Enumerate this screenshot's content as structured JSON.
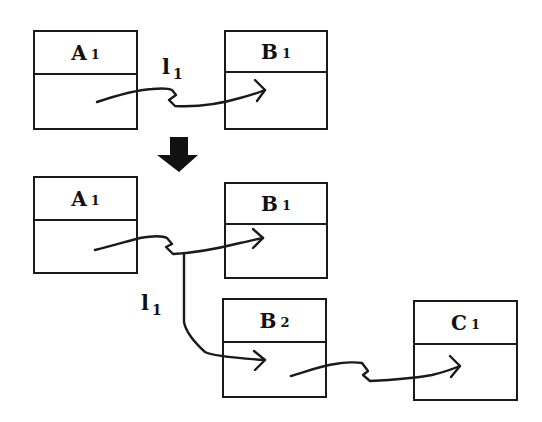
{
  "diagram": {
    "top": {
      "boxes": [
        {
          "id": "A1",
          "letter": "A",
          "index": "1"
        },
        {
          "id": "B1",
          "letter": "B",
          "index": "1"
        }
      ],
      "link_label": {
        "letter": "l",
        "index": "1"
      }
    },
    "transition_arrow": "down-arrow",
    "bottom": {
      "boxes": [
        {
          "id": "A1",
          "letter": "A",
          "index": "1"
        },
        {
          "id": "B1",
          "letter": "B",
          "index": "1"
        },
        {
          "id": "B2",
          "letter": "B",
          "index": "2"
        },
        {
          "id": "C1",
          "letter": "C",
          "index": "1"
        }
      ],
      "link_label": {
        "letter": "l",
        "index": "1"
      }
    },
    "colors": {
      "stroke": "#1a1a1a",
      "background": "#ffffff"
    }
  }
}
